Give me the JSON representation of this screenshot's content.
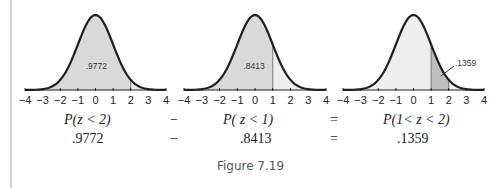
{
  "chart_data": [
    {
      "type": "area",
      "title": "Standard normal curve, shaded P(z < 2)",
      "x_ticks": [
        -4,
        -3,
        -2,
        -1,
        0,
        1,
        2,
        3,
        4
      ],
      "xlim": [
        -4,
        4
      ],
      "shaded_from": -4,
      "shaded_to": 2,
      "divider_at": 2,
      "area_label": ".9772"
    },
    {
      "type": "area",
      "title": "Standard normal curve, shaded P(z < 1)",
      "x_ticks": [
        -4,
        -3,
        -2,
        -1,
        0,
        1,
        2,
        3,
        4
      ],
      "xlim": [
        -4,
        4
      ],
      "shaded_from": -4,
      "shaded_to": 1,
      "divider_at": 1,
      "area_label": ".8413"
    },
    {
      "type": "area",
      "title": "Standard normal curve, shaded P(1 < z < 2)",
      "x_ticks": [
        -4,
        -3,
        -2,
        -1,
        0,
        1,
        2,
        3,
        4
      ],
      "xlim": [
        -4,
        4
      ],
      "shaded_from": 1,
      "shaded_to": 2,
      "dividers_at": [
        1,
        2
      ],
      "area_label": ".1359",
      "callout": true
    }
  ],
  "tick_labels": [
    "−4",
    "−3",
    "−2",
    "−1",
    "0",
    "1",
    "2",
    "3",
    "4"
  ],
  "equation": {
    "row1": {
      "term1": "P(z < 2)",
      "op1": "−",
      "term2": "P( z < 1)",
      "op2": "=",
      "term3": "P(1< z < 2)"
    },
    "row2": {
      "term1": ".9772",
      "op1": "−",
      "term2": ".8413",
      "op2": "=",
      "term3": ".1359"
    }
  },
  "caption": "Figure 7.19",
  "colors": {
    "curve": "#1f1f1f",
    "fill": "#d9d9d9",
    "fill_dark": "#bfbfbf",
    "axis": "#222222",
    "rule": "#cfcfcf"
  }
}
